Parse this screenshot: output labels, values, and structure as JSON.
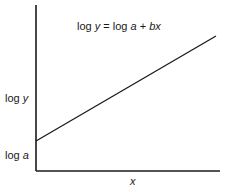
{
  "figure": {
    "type": "diagram"
  },
  "equation": {
    "lhs": "log",
    "lhs_var": "y",
    "equals": " = log ",
    "a": "a",
    "plus": " + ",
    "bx": "bx"
  },
  "axes": {
    "y_label_prefix": "log ",
    "y_label_var": "y",
    "x_label": "x",
    "intercept_label_prefix": "log ",
    "intercept_label_var": "a"
  },
  "geometry": {
    "y_axis": {
      "x": 36,
      "y1": 5,
      "y2": 171
    },
    "x_axis": {
      "y": 171,
      "x1": 36,
      "x2": 220
    },
    "line": {
      "x1": 36,
      "y1": 141,
      "x2": 216,
      "y2": 36
    }
  },
  "colors": {
    "ink": "#1a1a1a",
    "background": "#ffffff"
  }
}
